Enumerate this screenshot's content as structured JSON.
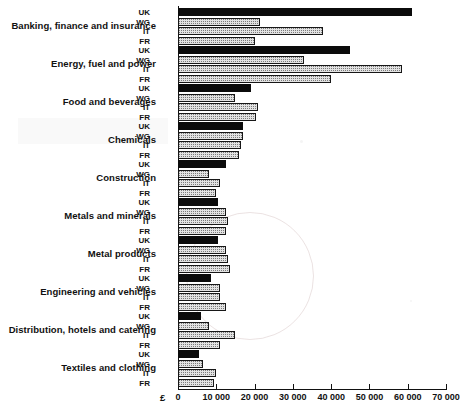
{
  "chart_data": {
    "type": "bar",
    "orientation": "horizontal",
    "title": "",
    "xlabel": "£",
    "ylabel": "",
    "xlim": [
      0,
      70000
    ],
    "xticks": [
      0,
      10000,
      20000,
      30000,
      40000,
      50000,
      60000,
      70000
    ],
    "xtick_labels": [
      "0",
      "10 000",
      "20 000",
      "30 000",
      "40 000",
      "50 000",
      "60 000",
      "70 000"
    ],
    "grid": false,
    "legend": "none",
    "currency_symbol": "£",
    "series_order": [
      "UK",
      "WG",
      "IT",
      "FR"
    ],
    "series_labels": {
      "UK": "UK",
      "WG": "WG",
      "IT": "IT",
      "FR": "FR"
    },
    "series_styles": {
      "UK": "solid-black",
      "WG": "stippled-grey",
      "IT": "stippled-grey",
      "FR": "stippled-grey"
    },
    "categories": [
      "Banking, finance and insurance",
      "Energy, fuel and power",
      "Food and beverages",
      "Chemicals",
      "Construction",
      "Metals and minerals",
      "Metal products",
      "Engineering and vehicles",
      "Distribution, hotels and catering",
      "Textiles and clothing"
    ],
    "series": [
      {
        "name": "UK",
        "values": [
          61000,
          45000,
          19000,
          17000,
          12500,
          10500,
          10500,
          8500,
          6000,
          5500
        ]
      },
      {
        "name": "WG",
        "values": [
          21500,
          33000,
          15000,
          17000,
          8000,
          12500,
          12500,
          11000,
          8000,
          6500
        ]
      },
      {
        "name": "IT",
        "values": [
          38000,
          58500,
          21000,
          16500,
          11000,
          13000,
          13000,
          11000,
          15000,
          10000
        ]
      },
      {
        "name": "FR",
        "values": [
          20000,
          40000,
          20500,
          16000,
          10000,
          12500,
          13500,
          12500,
          11000,
          9500
        ]
      }
    ]
  },
  "colors": {
    "bar_solid": "#0b0b0b",
    "bar_fill": "#e2e2e2",
    "bar_outline": "#171717",
    "axis": "#111111",
    "background": "#ffffff"
  }
}
